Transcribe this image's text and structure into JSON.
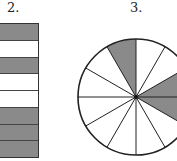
{
  "figures": [
    {
      "label": "2.",
      "type": "fraction-bar",
      "rows": [
        "shaded",
        "white",
        "shaded",
        "white",
        "white",
        "shaded",
        "shaded",
        "shaded"
      ],
      "shaded_count": 5,
      "total": 8
    },
    {
      "label": "3.",
      "type": "fraction-circle",
      "sectors": 12,
      "shaded_sectors": [
        0,
        3,
        4
      ],
      "shaded_count": 3,
      "total": 12
    }
  ],
  "colors": {
    "shaded": "#8a8a8a",
    "white": "#ffffff",
    "line": "#222222"
  }
}
